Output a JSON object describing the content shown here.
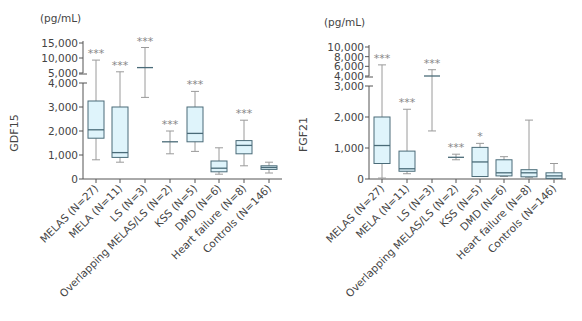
{
  "chart_data": [
    {
      "type": "box",
      "title": "",
      "ylabel": "GDF15",
      "unit": "(pg/mL)",
      "xlabel": "",
      "broken_axis": true,
      "lower_segment": {
        "ylim": [
          0,
          4000
        ],
        "ticks": [
          0,
          1000,
          2000,
          3000,
          4000
        ],
        "tick_labels": [
          "0",
          "1,000",
          "2,000",
          "3,000",
          "4,000"
        ]
      },
      "upper_segment": {
        "ylim": [
          5000,
          15000
        ],
        "ticks": [
          5000,
          10000,
          15000
        ],
        "tick_labels": [
          "5,000",
          "10,000",
          "15,000"
        ]
      },
      "categories": [
        "MELAS (N=27)",
        "MELA (N=11)",
        "LS (N=3)",
        "Overlapping MELAS/LS (N=2)",
        "KSS (N=5)",
        "DMD (N=6)",
        "Heart failure (N=8)",
        "Controls (N=146)"
      ],
      "boxes": [
        {
          "min": 800,
          "q1": 1700,
          "median": 2050,
          "q3": 3250,
          "max": 9300,
          "sig": "***"
        },
        {
          "min": 700,
          "q1": 900,
          "median": 1100,
          "q3": 3000,
          "max": 5400,
          "sig": "***"
        },
        {
          "min": 3400,
          "q1": null,
          "median": 6800,
          "q3": null,
          "max": 13500,
          "sig": "***"
        },
        {
          "min": 1050,
          "q1": null,
          "median": 1550,
          "q3": null,
          "max": 2000,
          "sig": "***"
        },
        {
          "min": 1150,
          "q1": 1550,
          "median": 1900,
          "q3": 3000,
          "max": 3650,
          "sig": "***"
        },
        {
          "min": 200,
          "q1": 300,
          "median": 450,
          "q3": 750,
          "max": 1300,
          "sig": ""
        },
        {
          "min": 550,
          "q1": 1050,
          "median": 1400,
          "q3": 1600,
          "max": 2450,
          "sig": "***"
        },
        {
          "min": 250,
          "q1": 400,
          "median": 480,
          "q3": 550,
          "max": 700,
          "sig": ""
        }
      ]
    },
    {
      "type": "box",
      "title": "",
      "ylabel": "FGF21",
      "unit": "(pg/mL)",
      "xlabel": "",
      "broken_axis": true,
      "lower_segment": {
        "ylim": [
          0,
          3000
        ],
        "ticks": [
          0,
          1000,
          2000,
          3000
        ],
        "tick_labels": [
          "0",
          "1,000",
          "2,000",
          "3,000"
        ]
      },
      "upper_segment": {
        "ylim": [
          4000,
          10000
        ],
        "ticks": [
          4000,
          6000,
          8000,
          10000
        ],
        "tick_labels": [
          "4,000",
          "6,000",
          "8,000",
          "10,000"
        ]
      },
      "categories": [
        "MELAS (N=27)",
        "MELA (N=11)",
        "LS (N=3)",
        "Overlapping MELAS/LS (N=2)",
        "KSS (N=5)",
        "DMD (N=6)",
        "Heart failure (N=8)",
        "Controls (N=146)"
      ],
      "boxes": [
        {
          "min": 30,
          "q1": 500,
          "median": 1080,
          "q3": 2000,
          "max": 6300,
          "sig": "***"
        },
        {
          "min": 170,
          "q1": 250,
          "median": 330,
          "q3": 900,
          "max": 2250,
          "sig": "***"
        },
        {
          "min": 1550,
          "q1": null,
          "median": 4000,
          "q3": null,
          "max": 5300,
          "sig": "***"
        },
        {
          "min": 620,
          "q1": null,
          "median": 700,
          "q3": null,
          "max": 800,
          "sig": "***"
        },
        {
          "min": 80,
          "q1": 80,
          "median": 550,
          "q3": 1020,
          "max": 1150,
          "sig": "*"
        },
        {
          "min": 80,
          "q1": 100,
          "median": 200,
          "q3": 620,
          "max": 720,
          "sig": ""
        },
        {
          "min": 40,
          "q1": 70,
          "median": 200,
          "q3": 300,
          "max": 1900,
          "sig": ""
        },
        {
          "min": 0,
          "q1": 20,
          "median": 100,
          "q3": 200,
          "max": 500,
          "sig": ""
        }
      ]
    }
  ],
  "colors": {
    "box_fill": "#dff4fb",
    "box_stroke": "#4a6b78",
    "whisker": "#9a9a9a",
    "axis": "#555555",
    "star": "#8a8a8a"
  }
}
